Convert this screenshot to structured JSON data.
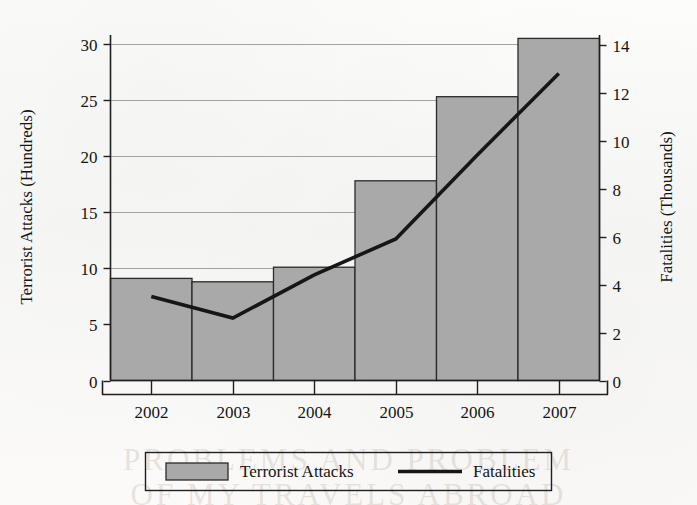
{
  "page": {
    "ghost_text_line1": "PROBLEMS AND PROBLEM",
    "ghost_text_line2": "OF MY TRAVELS ABROAD"
  },
  "chart_data": {
    "type": "bar",
    "title": "",
    "subtitle": "",
    "xlabel": "",
    "categories": [
      "2002",
      "2003",
      "2004",
      "2005",
      "2006",
      "2007"
    ],
    "grid": true,
    "legend_position": "bottom",
    "colors": {
      "bar_fill": "#a9a9a9",
      "bar_stroke": "#2a2a2a",
      "line": "#161616",
      "gridline": "#8d8d8d",
      "axis": "#1f1f1f",
      "background": "#fbfbfa"
    },
    "axes": {
      "left": {
        "label": "Terrorist Attacks (Hundreds)",
        "ticks": [
          "0",
          "5",
          "10",
          "15",
          "20",
          "25",
          "30"
        ],
        "tick_values": [
          0,
          5,
          10,
          15,
          20,
          25,
          30
        ],
        "min": 0,
        "max": 30.8
      },
      "right": {
        "label": "Fatalities (Thousands)",
        "ticks": [
          "0",
          "2",
          "4",
          "6",
          "8",
          "10",
          "12",
          "14"
        ],
        "tick_values": [
          0,
          2,
          4,
          6,
          8,
          10,
          12,
          14
        ],
        "min": 0,
        "max": 14.4
      }
    },
    "series": [
      {
        "name": "Terrorist Attacks",
        "kind": "bar",
        "axis": "left",
        "unit": "hundreds",
        "values": [
          9.1,
          8.8,
          10.1,
          17.8,
          25.3,
          30.5
        ]
      },
      {
        "name": "Fatalities",
        "kind": "line",
        "axis": "right",
        "unit": "thousands",
        "values": [
          3.5,
          2.6,
          4.4,
          5.9,
          9.4,
          12.8
        ]
      }
    ],
    "legend": [
      {
        "label": "Terrorist Attacks",
        "marker": "swatch"
      },
      {
        "label": "Fatalities",
        "marker": "line"
      }
    ]
  }
}
